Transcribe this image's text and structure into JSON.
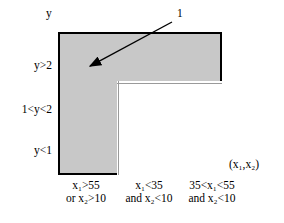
{
  "diagram": {
    "title_region": "decision-region-map",
    "axes": {
      "y_axis_label": "y",
      "x_axis_label": "(x₁,x₂)"
    },
    "y_ticks": [
      {
        "id": "high",
        "label": "y>2"
      },
      {
        "id": "mid",
        "label": "1<y<2"
      },
      {
        "id": "low",
        "label": "y<1"
      }
    ],
    "x_ticks": [
      {
        "id": "col1",
        "line1": "x₁>55",
        "line2": "or x₂>10"
      },
      {
        "id": "col2",
        "line1": "x₁<35",
        "line2": "and x₂<10"
      },
      {
        "id": "col3",
        "line1": "35<x₁<55",
        "line2": "and x₂<10"
      }
    ],
    "annotation": {
      "callout_label": "1",
      "arrow_from_x": 172,
      "arrow_from_y": 22,
      "arrow_to_x": 83,
      "arrow_to_y": 70
    },
    "colors": {
      "shaded_region": "#c8c8c8",
      "unshaded_region": "#ffffff",
      "frame_border": "#000000",
      "grid_line": "#9a9a9a",
      "text": "#000000",
      "background": "#ffffff"
    },
    "regions": {
      "shaded_description": "shaded region 1 (left column plus top band)",
      "unshaded_description": "white region of four cells"
    }
  }
}
